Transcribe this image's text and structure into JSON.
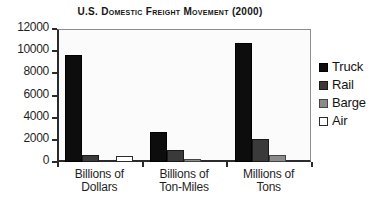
{
  "chart_data": {
    "type": "bar",
    "title": "U.S. Domestic Freight Movement (2000)",
    "xlabel": "",
    "ylabel": "",
    "ylim": [
      0,
      12000
    ],
    "yticks": [
      0,
      2000,
      4000,
      6000,
      8000,
      10000,
      12000
    ],
    "ytick_labels": [
      "0",
      "2000",
      "4000",
      "6000",
      "8000",
      "10000",
      "12000"
    ],
    "grid": false,
    "legend_position": "right",
    "categories": [
      "Billions of Dollars",
      "Billions of Ton-Miles",
      "Millions of Tons"
    ],
    "category_lines": [
      [
        "Billions of",
        "Dollars"
      ],
      [
        "Billions of",
        "Ton-Miles"
      ],
      [
        "Millions of",
        "Tons"
      ]
    ],
    "series": [
      {
        "name": "Truck",
        "color": "#0d0d0d",
        "values": [
          9700,
          2700,
          10700
        ]
      },
      {
        "name": "Rail",
        "color": "#3a3a3a",
        "values": [
          650,
          1050,
          2050
        ]
      },
      {
        "name": "Barge",
        "color": "#8a8a8a",
        "values": [
          0,
          280,
          600
        ]
      },
      {
        "name": "Air",
        "color": "#ffffff",
        "values": [
          580,
          0,
          0
        ]
      }
    ]
  },
  "legend": {
    "items": [
      {
        "label": "Truck",
        "swatch": "truck"
      },
      {
        "label": "Rail",
        "swatch": "rail"
      },
      {
        "label": "Barge",
        "swatch": "barge"
      },
      {
        "label": "Air",
        "swatch": "air"
      }
    ]
  }
}
